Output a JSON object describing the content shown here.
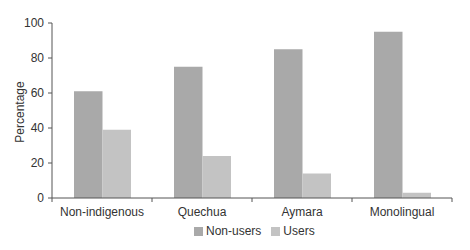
{
  "chart_data": {
    "type": "bar",
    "title": "",
    "xlabel": "",
    "ylabel": "Percentage",
    "ylim": [
      0,
      100
    ],
    "yticks": [
      0,
      20,
      40,
      60,
      80,
      100
    ],
    "grid": false,
    "legend_position": "bottom",
    "categories": [
      "Non-indigenous",
      "Quechua",
      "Aymara",
      "Monolingual"
    ],
    "series": [
      {
        "name": "Non-users",
        "color": "#a9a9a9",
        "values": [
          61,
          75,
          85,
          95
        ]
      },
      {
        "name": "Users",
        "color": "#c3c3c3",
        "values": [
          39,
          24,
          14,
          3
        ]
      }
    ]
  },
  "legend": {
    "items": [
      {
        "label": "Non-users",
        "color": "#a9a9a9"
      },
      {
        "label": "Users",
        "color": "#c3c3c3"
      }
    ]
  }
}
